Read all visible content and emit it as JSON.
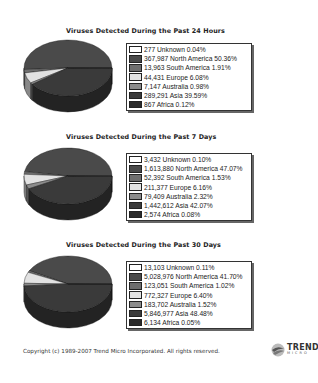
{
  "colors": {
    "Unknown": "#ffffff",
    "North America": "#4a4a4a",
    "South America": "#6e6e6e",
    "Europe": "#e2e2e2",
    "Australia": "#8c8c8c",
    "Asia": "#3a3a3a",
    "Africa": "#2a2a2a"
  },
  "charts": [
    {
      "title": "Viruses Detected During the Past 24 Hours",
      "legend": [
        {
          "label": "277 Unknown  0.04%"
        },
        {
          "label": "367,987 North America  50.36%"
        },
        {
          "label": "13,963 South America  1.91%"
        },
        {
          "label": "44,431 Europe  6.08%"
        },
        {
          "label": "7,147 Australia  0.98%"
        },
        {
          "label": "289,291 Asia  39.59%"
        },
        {
          "label": "867 Africa  0.12%"
        }
      ]
    },
    {
      "title": "Viruses Detected During the Past 7 Days",
      "legend": [
        {
          "label": "3,432 Unknown  0.10%"
        },
        {
          "label": "1,613,880 North America  47.07%"
        },
        {
          "label": "52,392 South America  1.53%"
        },
        {
          "label": "211,377 Europe  6.16%"
        },
        {
          "label": "79,409 Australia  2.32%"
        },
        {
          "label": "1,442,612 Asia  42.07%"
        },
        {
          "label": "2,574 Africa  0.08%"
        }
      ]
    },
    {
      "title": "Viruses Detected During the Past 30 Days",
      "legend": [
        {
          "label": "13,103 Unknown  0.11%"
        },
        {
          "label": "5,028,976 North America  41.70%"
        },
        {
          "label": "123,051 South America  1.02%"
        },
        {
          "label": "772,327 Europe  6.40%"
        },
        {
          "label": "183,702 Australia  1.52%"
        },
        {
          "label": "5,846,977 Asia  48.48%"
        },
        {
          "label": "6,134 Africa  0.05%"
        }
      ]
    }
  ],
  "footer": {
    "copyright": "Copyright (c) 1989-2007 Trend Micro Incorporated. All rights reserved.",
    "logo_main": "TREND",
    "logo_sub": "MICRO"
  },
  "chart_data": [
    {
      "type": "pie",
      "title": "Viruses Detected During the Past 24 Hours",
      "categories": [
        "Unknown",
        "North America",
        "South America",
        "Europe",
        "Australia",
        "Asia",
        "Africa"
      ],
      "values": [
        277,
        367987,
        13963,
        44431,
        7147,
        289291,
        867
      ],
      "percentages": [
        0.04,
        50.36,
        1.91,
        6.08,
        0.98,
        39.59,
        0.12
      ],
      "legend_position": "right"
    },
    {
      "type": "pie",
      "title": "Viruses Detected During the Past 7 Days",
      "categories": [
        "Unknown",
        "North America",
        "South America",
        "Europe",
        "Australia",
        "Asia",
        "Africa"
      ],
      "values": [
        3432,
        1613880,
        52392,
        211377,
        79409,
        1442612,
        2574
      ],
      "percentages": [
        0.1,
        47.07,
        1.53,
        6.16,
        2.32,
        42.07,
        0.08
      ],
      "legend_position": "right"
    },
    {
      "type": "pie",
      "title": "Viruses Detected During the Past 30 Days",
      "categories": [
        "Unknown",
        "North America",
        "South America",
        "Europe",
        "Australia",
        "Asia",
        "Africa"
      ],
      "values": [
        13103,
        5028976,
        123051,
        772327,
        183702,
        5846977,
        6134
      ],
      "percentages": [
        0.11,
        41.7,
        1.02,
        6.4,
        1.52,
        48.48,
        0.05
      ],
      "legend_position": "right"
    }
  ]
}
